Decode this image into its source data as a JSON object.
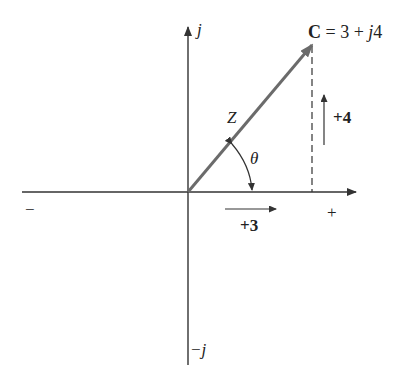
{
  "diagram": {
    "type": "complex-plane-phasor",
    "axes": {
      "positive_imag_label": "j",
      "negative_imag_label": "−j",
      "positive_real_label": "+",
      "negative_real_label": "−"
    },
    "phasor": {
      "name_bold": "C",
      "equation_rest": " = 3 + ",
      "imag_part_j": "j",
      "imag_value": "4",
      "magnitude_label": "Z",
      "angle_label": "θ",
      "real": 3,
      "imag": 4
    },
    "components": {
      "real_label": "+3",
      "imag_label": "+4"
    },
    "colors": {
      "axis": "#333333",
      "phasor": "#6b6b6b",
      "text": "#222222"
    }
  }
}
